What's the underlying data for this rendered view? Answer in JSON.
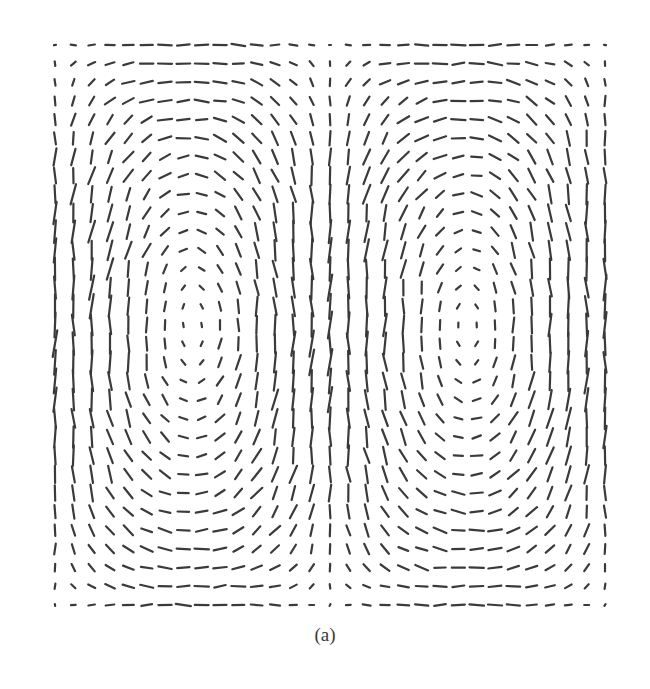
{
  "figure": {
    "caption": "(a)",
    "line_color": "#3a3a3a",
    "background": "#ffffff"
  },
  "chart_data": {
    "type": "vector_field",
    "title": "",
    "xlabel": "",
    "ylabel": "",
    "grid": false,
    "legend": null,
    "domain_px": {
      "x0": 55,
      "x1": 605,
      "y0": 45,
      "y1": 605
    },
    "columns": 31,
    "rows": 31,
    "vortices": [
      {
        "name": "left",
        "center_px": [
          245,
          318
        ],
        "rotation": "counterclockwise"
      },
      {
        "name": "right",
        "center_px": [
          423,
          318
        ],
        "rotation": "clockwise"
      }
    ],
    "symmetry": "mirror about vertical midline x=335 (midline column shows only dots, ~zero magnitude)",
    "segment_max_length_px": 24,
    "segment_min_length_px": 2,
    "line_width_px": 2.2
  }
}
